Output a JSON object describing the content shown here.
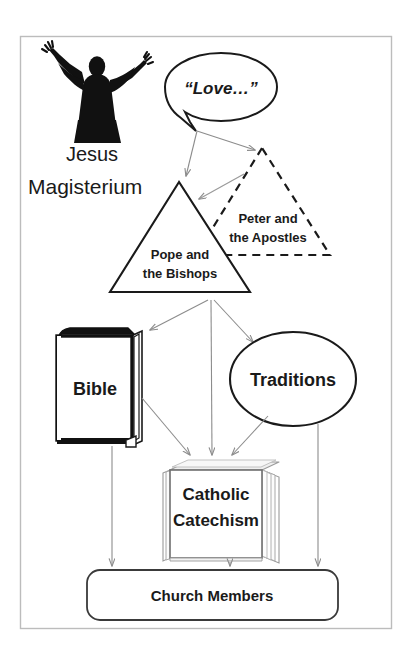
{
  "figure": {
    "frame": {
      "stroke": "#b8b8b8",
      "fill": "#ffffff"
    },
    "colors": {
      "ink": "#1a1a1a",
      "line": "#000000",
      "arrow_gray": "#8c8c8c",
      "arrow_dark": "#6e6e6e",
      "page_shade": "#f2f2f2",
      "page_edge": "#c9c9c9"
    },
    "nodes": {
      "jesus": {
        "label": "Jesus",
        "icon": "jesus-silhouette-icon",
        "label_x": 92,
        "label_y": 160,
        "font_size": 20,
        "weight": "normal"
      },
      "speech_bubble": {
        "label": "“Love…”",
        "cx": 221,
        "cy": 87,
        "rx": 56,
        "ry": 34,
        "font_size": 17,
        "style": "bold-italic"
      },
      "magisterium": {
        "label": "Magisterium",
        "label_x": 100,
        "label_y": 193,
        "font_size": 21,
        "weight": "normal"
      },
      "pope_bishops": {
        "label_line1": "Pope and",
        "label_line2": "the Bishops",
        "shape": "triangle",
        "border": "solid",
        "apex": [
          179,
          182
        ],
        "base_left": [
          110,
          292
        ],
        "base_right": [
          250,
          292
        ],
        "font_size": 13
      },
      "peter_apostles": {
        "label_line1": "Peter and",
        "label_line2": "the Apostles",
        "shape": "triangle",
        "border": "dashed",
        "apex": [
          262,
          148
        ],
        "base_left": [
          196,
          255
        ],
        "base_right": [
          330,
          255
        ],
        "font_size": 13
      },
      "bible": {
        "label": "Bible",
        "shape": "closed-book",
        "x": 56,
        "y": 327,
        "w": 86,
        "h": 116,
        "font_size": 18
      },
      "traditions": {
        "label": "Traditions",
        "shape": "ellipse",
        "cx": 293,
        "cy": 379,
        "rx": 63,
        "ry": 47,
        "font_size": 18
      },
      "catechism": {
        "label_line1": "Catholic",
        "label_line2": "Catechism",
        "shape": "page-stack-book",
        "x": 161,
        "y": 462,
        "w": 110,
        "h": 98,
        "font_size": 17
      },
      "church_members": {
        "label": "Church Members",
        "shape": "rounded-rect",
        "x": 87,
        "y": 570,
        "w": 251,
        "h": 50,
        "font_size": 15
      }
    },
    "arrows": [
      {
        "name": "love-to-apostles",
        "from": "speech_bubble",
        "to": "peter_apostles",
        "style": "thin-gray"
      },
      {
        "name": "love-to-pope",
        "from": "speech_bubble",
        "to": "pope_bishops",
        "style": "thin-gray"
      },
      {
        "name": "magisterium-to-bible",
        "from": "pope_bishops",
        "to": "bible",
        "style": "thin-gray"
      },
      {
        "name": "magisterium-to-traditions",
        "from": "pope_bishops",
        "to": "traditions",
        "style": "thin-gray"
      },
      {
        "name": "magisterium-to-catechism",
        "from": "pope_bishops",
        "to": "catechism",
        "style": "thin-gray"
      },
      {
        "name": "bible-to-catechism",
        "from": "bible",
        "to": "catechism",
        "style": "thin-gray"
      },
      {
        "name": "traditions-to-catechism",
        "from": "traditions",
        "to": "catechism",
        "style": "thin-gray"
      },
      {
        "name": "bible-to-members",
        "from": "bible",
        "to": "church_members",
        "style": "thin-gray"
      },
      {
        "name": "catechism-to-members",
        "from": "catechism",
        "to": "church_members",
        "style": "thin-gray"
      },
      {
        "name": "traditions-to-members",
        "from": "traditions",
        "to": "church_members",
        "style": "thin-gray"
      }
    ]
  }
}
